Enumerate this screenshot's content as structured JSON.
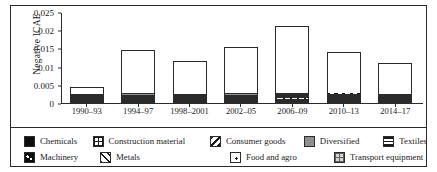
{
  "chart_data": {
    "type": "bar",
    "subtype": "stacked-bar",
    "title": "",
    "xlabel": "",
    "ylabel": "Negative ICAE",
    "ylim": [
      0,
      0.025
    ],
    "yticks": [
      "0",
      "0.005",
      "0.01",
      "0.015",
      "0.02",
      "0.025"
    ],
    "ytick_values": [
      0,
      0.005,
      0.01,
      0.015,
      0.02,
      0.025
    ],
    "grid": false,
    "legend_position": "bottom",
    "categories": [
      "1990–93",
      "1994–97",
      "1998–2001",
      "2002–05",
      "2006–09",
      "2010–13",
      "2014–17"
    ],
    "series": [
      {
        "name": "Chemicals",
        "pattern": "solid-black",
        "values": [
          0.0012,
          0.004,
          0.0022,
          0.0036,
          0.0046,
          0.0035,
          0.0022
        ]
      },
      {
        "name": "Machinery",
        "pattern": "black-dots",
        "values": [
          0.0004,
          0.0006,
          0.0005,
          0.0006,
          0.0008,
          0.0005,
          0.0004
        ]
      },
      {
        "name": "Transport equipment",
        "pattern": "grey-grid",
        "values": [
          0.0005,
          0.0012,
          0.001,
          0.0018,
          0.0022,
          0.0014,
          0.0018
        ]
      },
      {
        "name": "Metals",
        "pattern": "diagonal-hatch-up",
        "values": [
          0.0004,
          0.0014,
          0.001,
          0.0008,
          0.0018,
          0.0008,
          0.0006
        ]
      },
      {
        "name": "Food and agro",
        "pattern": "dotted",
        "values": [
          0.0006,
          0.0022,
          0.0014,
          0.0012,
          0.0014,
          0.0012,
          0.0016
        ]
      },
      {
        "name": "Construction material",
        "pattern": "cross-grid",
        "values": [
          0.0003,
          0.0008,
          0.0009,
          0.001,
          0.001,
          0.0008,
          0.0008
        ]
      },
      {
        "name": "Textiles",
        "pattern": "horizontal-lines",
        "values": [
          0.0004,
          0.0012,
          0.0014,
          0.0016,
          0.0014,
          0.0012,
          0.001
        ]
      },
      {
        "name": "Diversified",
        "pattern": "solid-grey",
        "values": [
          0.0004,
          0.002,
          0.0022,
          0.003,
          0.0058,
          0.0032,
          0.0012
        ]
      },
      {
        "name": "Consumer goods",
        "pattern": "diagonal-hatch-down",
        "values": [
          0.0003,
          0.0014,
          0.0012,
          0.0019,
          0.0025,
          0.0016,
          0.0014
        ]
      }
    ],
    "totals": [
      0.0045,
      0.0148,
      0.0118,
      0.0155,
      0.0215,
      0.0142,
      0.011
    ]
  },
  "axis": {
    "ylabel": "Negative ICAE",
    "ytick_0": "0",
    "ytick_1": "0.005",
    "ytick_2": "0.01",
    "ytick_3": "0.015",
    "ytick_4": "0.02",
    "ytick_5": "0.025"
  },
  "legend": {
    "row1": [
      {
        "label": "Chemicals",
        "key": "chemicals"
      },
      {
        "label": "Construction material",
        "key": "construction"
      },
      {
        "label": "Consumer goods",
        "key": "consumer"
      },
      {
        "label": "Diversified",
        "key": "diversified"
      },
      {
        "label": "Textiles",
        "key": "textiles"
      }
    ],
    "row2": [
      {
        "label": "Machinery",
        "key": "machinery"
      },
      {
        "label": "Metals",
        "key": "metals"
      },
      {
        "label": "Food and agro",
        "key": "food"
      },
      {
        "label": "Transport equipment",
        "key": "transport"
      }
    ]
  },
  "colors": {
    "ink": "#1a1a1a",
    "frame": "#2b2b2b",
    "background": "#ffffff",
    "grey_fill": "#8f8f8f",
    "light_grey_fill": "#bdbdbd"
  }
}
